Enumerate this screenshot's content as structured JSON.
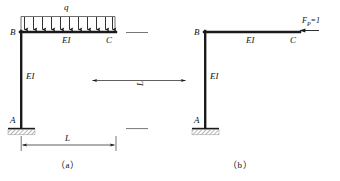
{
  "figure": {
    "panels": [
      {
        "id": "a",
        "caption": "（a）",
        "joints": {
          "top_left": "B",
          "top_right": "C",
          "base": "A"
        },
        "members": {
          "beam_stiffness": "EI",
          "column_stiffness": "EI"
        },
        "load": {
          "type": "uniformly-distributed",
          "symbol": "q",
          "arrow_count": 11,
          "direction": "down"
        },
        "dimensions": {
          "horizontal": "L",
          "vertical": "L"
        },
        "support": {
          "type": "fixed",
          "at": "A"
        }
      },
      {
        "id": "b",
        "caption": "（b）",
        "joints": {
          "top_left": "B",
          "top_right": "C",
          "base": "A"
        },
        "members": {
          "beam_stiffness": "EI",
          "column_stiffness": "EI"
        },
        "load": {
          "type": "concentrated-unit-force",
          "symbol_main": "F",
          "symbol_sub": "P",
          "symbol_value": "=1",
          "direction": "left"
        },
        "support": {
          "type": "fixed",
          "at": "A"
        }
      }
    ],
    "colors": {
      "frame": "#1a1a1a",
      "thin_line": "#555555",
      "hatch": "#7a7a7a",
      "background": "#ffffff"
    }
  }
}
